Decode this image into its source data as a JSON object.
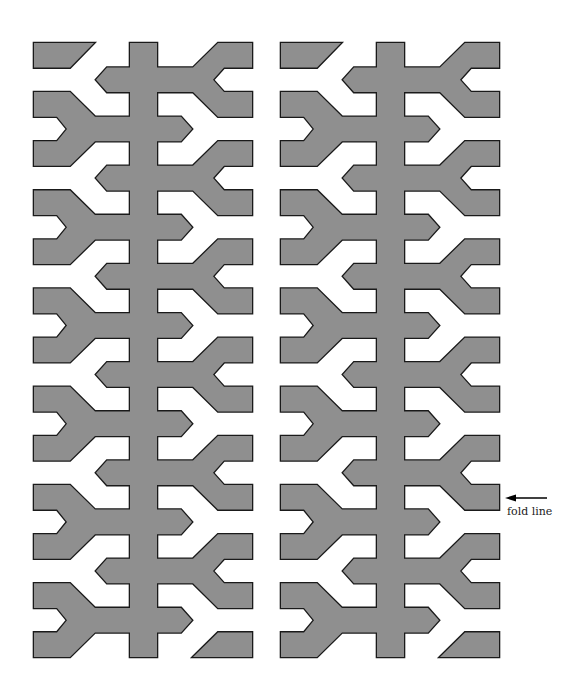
{
  "diagram": {
    "title": "",
    "band_height": 24.56,
    "top": 43,
    "bands": 25,
    "period_bands": 4,
    "strip_offsets_x": [
      34,
      281
    ],
    "geometry": {
      "width": 218,
      "spine_left": 96,
      "spine_right": 123,
      "left_notch_inner": 23,
      "left_notch_tip": 33,
      "left_arm_end": 36,
      "left_diag_end": 61,
      "left_arrow_base": 73,
      "left_arrow_tip": 62,
      "right_arrow_base": 147,
      "right_arrow_tip": 158,
      "right_diag_start": 159,
      "right_arm_start": 184,
      "right_notch_inner": 190,
      "right_notch_tip": 179,
      "end_cap_top_width": 60
    },
    "left_y_start_bands": [
      2,
      6,
      10,
      14,
      18,
      22
    ],
    "right_y_start_bands": [
      0,
      4,
      8,
      12,
      16,
      20
    ],
    "colors": {
      "fill": "#8f8f8f",
      "stroke": "#1a1a1a",
      "background": "#ffffff",
      "arrow": "#000000"
    },
    "annotation": {
      "text": "fold line",
      "arrow_x1": 547,
      "arrow_x2": 505,
      "arrow_y": 498,
      "text_x": 507,
      "text_y": 505
    }
  }
}
